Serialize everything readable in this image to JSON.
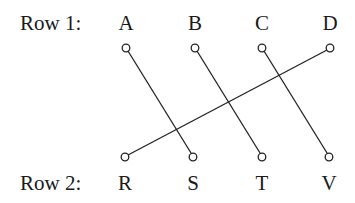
{
  "rows": [
    {
      "label": "Row 1:",
      "nodes": [
        {
          "id": "A",
          "label": "A",
          "x": 126
        },
        {
          "id": "B",
          "label": "B",
          "x": 195
        },
        {
          "id": "C",
          "label": "C",
          "x": 262
        },
        {
          "id": "D",
          "label": "D",
          "x": 330
        }
      ]
    },
    {
      "label": "Row 2:",
      "nodes": [
        {
          "id": "R",
          "label": "R",
          "x": 125
        },
        {
          "id": "S",
          "label": "S",
          "x": 193
        },
        {
          "id": "T",
          "label": "T",
          "x": 262
        },
        {
          "id": "V",
          "label": "V",
          "x": 329
        }
      ]
    }
  ],
  "connections": [
    {
      "from": "A",
      "to": "S"
    },
    {
      "from": "B",
      "to": "T"
    },
    {
      "from": "C",
      "to": "V"
    },
    {
      "from": "D",
      "to": "R"
    }
  ]
}
